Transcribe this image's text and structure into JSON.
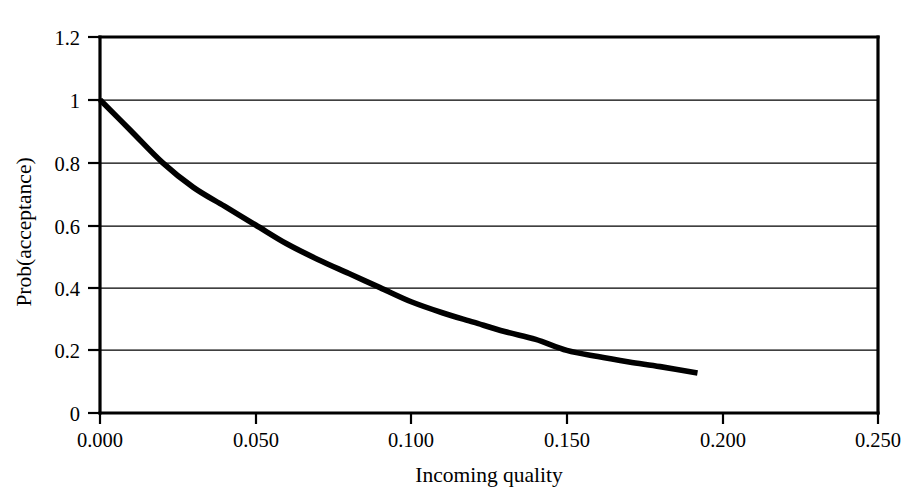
{
  "chart_data": {
    "type": "line",
    "title": "",
    "subtitle": "",
    "xlabel": "Incoming quality",
    "ylabel": "Prob(acceptance)",
    "xlim": [
      0.0,
      0.25
    ],
    "ylim": [
      0.0,
      1.2
    ],
    "grid": "horizontal",
    "legend": "none",
    "x_tick_labels": [
      "0.000",
      "0.050",
      "0.100",
      "0.150",
      "0.200",
      "0.250"
    ],
    "x_tick_values": [
      0.0,
      0.05,
      0.1,
      0.15,
      0.2,
      0.25
    ],
    "y_tick_labels": [
      "0",
      "0.2",
      "0.4",
      "0.6",
      "0.8",
      "1",
      "1.2"
    ],
    "y_tick_values": [
      0.0,
      0.2,
      0.4,
      0.6,
      0.8,
      1.0,
      1.2
    ],
    "series": [
      {
        "name": "OC curve",
        "color": "#000000",
        "x": [
          0.0,
          0.01,
          0.02,
          0.03,
          0.04,
          0.05,
          0.06,
          0.07,
          0.08,
          0.09,
          0.1,
          0.11,
          0.12,
          0.13,
          0.14,
          0.15,
          0.16,
          0.17,
          0.18,
          0.192
        ],
        "y": [
          1.0,
          0.9,
          0.8,
          0.72,
          0.66,
          0.6,
          0.54,
          0.49,
          0.445,
          0.4,
          0.355,
          0.32,
          0.29,
          0.26,
          0.235,
          0.2,
          0.18,
          0.163,
          0.148,
          0.128
        ]
      }
    ]
  },
  "axes": {
    "x_axis_name": "Incoming quality",
    "y_axis_name": "Prob(acceptance)"
  }
}
